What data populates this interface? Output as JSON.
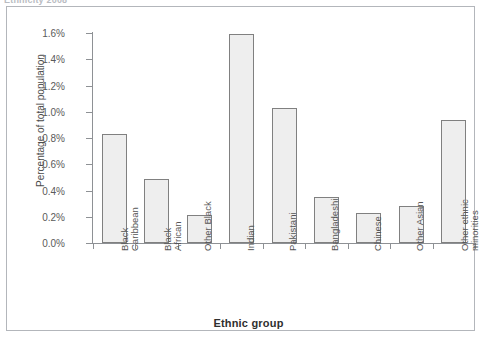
{
  "top_caption": "Ethnicity 2008",
  "chart_data": {
    "type": "bar",
    "title": "",
    "xlabel": "Ethnic group",
    "ylabel": "Percentage of  total population",
    "categories": [
      "Black Caribbean",
      "Black African",
      "Other Black",
      "Indian",
      "Pakistani",
      "Bangladeshi",
      "Chinese",
      "Other Asian",
      "Other ethnic minorities"
    ],
    "category_lines": [
      [
        "Black",
        "Caribbean"
      ],
      [
        "Black",
        "African"
      ],
      [
        "Other Black"
      ],
      [
        "Indian"
      ],
      [
        "Pakistani"
      ],
      [
        "Bangladeshi"
      ],
      [
        "Chinese"
      ],
      [
        "Other Asian"
      ],
      [
        "Other ethnic",
        "minorities"
      ]
    ],
    "values": [
      0.83,
      0.49,
      0.21,
      1.59,
      1.03,
      0.35,
      0.23,
      0.28,
      0.94
    ],
    "value_labels": [
      "0.83%",
      "0.49%",
      "0.21%",
      "1.59%",
      "1.03%",
      "0.35%",
      "0.23%",
      "0.28%",
      "0.94%"
    ],
    "ylim": [
      0.0,
      1.6
    ],
    "ytick_values": [
      0.0,
      0.2,
      0.4,
      0.6,
      0.8,
      1.0,
      1.2,
      1.4,
      1.6
    ],
    "ytick_labels": [
      "0.0%",
      "0.2%",
      "0.4%",
      "0.6%",
      "0.8%",
      "1.0%",
      "1.2%",
      "1.4%",
      "1.6%"
    ],
    "grid": false,
    "legend": "none",
    "bar_fill_color": "#eeeeee",
    "bar_border_color": "#808080",
    "axis_color": "#8e9195",
    "panel_border_color": "#b3b6bb",
    "background_color": "#ffffff"
  }
}
